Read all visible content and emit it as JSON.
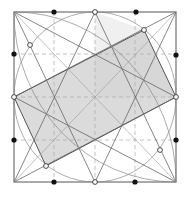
{
  "diagram": {
    "title": "",
    "colors": {
      "frame": "#555555",
      "shade": "#cfcfcf",
      "filled_point": "#111111",
      "open_point": "#ffffff"
    },
    "filled_point_count": 8,
    "open_point_count": 8
  }
}
